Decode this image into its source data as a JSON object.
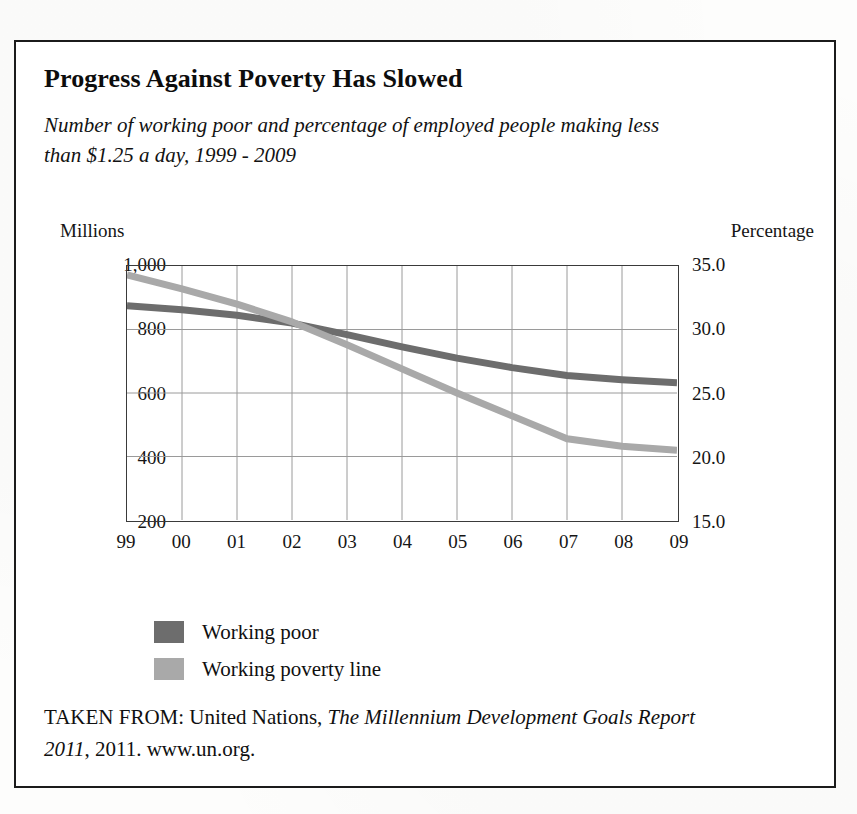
{
  "figure": {
    "title": "Progress Against Poverty Has Slowed",
    "subtitle": "Number of working poor and percentage of employed people making less than $1.25 a day, 1999 - 2009",
    "left_axis_header": "Millions",
    "right_axis_header": "Percentage",
    "source_prefix": "TAKEN FROM: United Nations, ",
    "source_italic_1": "The Millennium Development Goals Report 2011",
    "source_suffix": ", 2011. www.un.org."
  },
  "legend": {
    "items": [
      {
        "label": "Working poor",
        "color": "#6d6d6d"
      },
      {
        "label": "Working poverty line",
        "color": "#a9a9a9"
      }
    ]
  },
  "colors": {
    "working_poor": "#6d6d6d",
    "working_poverty_line": "#a9a9a9",
    "frame": "#1b1b1b",
    "plot_border": "#3a3a3a",
    "gridline": "#9a9a9a",
    "text": "#111111"
  },
  "chart_data": {
    "type": "line",
    "title": "Progress Against Poverty Has Slowed",
    "subtitle": "Number of working poor and percentage of employed people making less than $1.25 a day, 1999 - 2009",
    "xlabel": "",
    "categories": [
      "99",
      "00",
      "01",
      "02",
      "03",
      "04",
      "05",
      "06",
      "07",
      "08",
      "09"
    ],
    "x_tick_labels": [
      "99",
      "00",
      "01",
      "02",
      "03",
      "04",
      "05",
      "06",
      "07",
      "08",
      "09"
    ],
    "grid": true,
    "legend_position": "below-left",
    "axes": [
      {
        "id": "left",
        "side": "left",
        "header": "Millions",
        "ylabel": "Millions",
        "ylim": [
          200,
          1000
        ],
        "ticks": [
          200,
          400,
          600,
          800,
          1000
        ],
        "tick_labels": [
          "200",
          "400",
          "600",
          "800",
          "1,000"
        ]
      },
      {
        "id": "right",
        "side": "right",
        "header": "Percentage",
        "ylabel": "Percentage",
        "ylim": [
          15.0,
          35.0
        ],
        "ticks": [
          15.0,
          20.0,
          25.0,
          30.0,
          35.0
        ],
        "tick_labels": [
          "15.0",
          "20.0",
          "25.0",
          "30.0",
          "35.0"
        ]
      }
    ],
    "series": [
      {
        "name": "Working poor",
        "axis": "left",
        "unit": "millions",
        "color": "#6d6d6d",
        "values": [
          875,
          862,
          845,
          820,
          784,
          745,
          710,
          680,
          655,
          642,
          632
        ]
      },
      {
        "name": "Working poverty line",
        "axis": "right",
        "unit": "percent",
        "color": "#a9a9a9",
        "values": [
          34.3,
          33.2,
          32.0,
          30.6,
          28.8,
          26.9,
          25.0,
          23.2,
          21.4,
          20.8,
          20.5
        ]
      }
    ],
    "annotations": []
  }
}
